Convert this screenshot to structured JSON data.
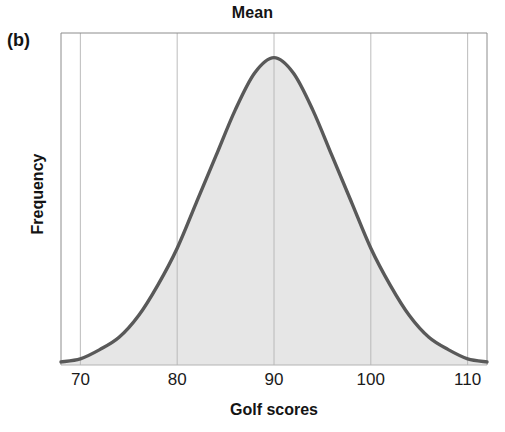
{
  "figure": {
    "panel_label": "(b)",
    "title": "Mean",
    "xlabel": "Golf scores",
    "ylabel": "Frequency"
  },
  "colors": {
    "curve_stroke": "#595959",
    "area_fill": "#e6e6e6",
    "gridline": "#b4b4b4",
    "axis_border": "#8c8c8c",
    "text": "#141414",
    "background": "#ffffff"
  },
  "chart_data": {
    "type": "area",
    "title": "Mean",
    "xlabel": "Golf scores",
    "ylabel": "Frequency",
    "xlim": [
      68,
      112
    ],
    "ylim": [
      0,
      1.08
    ],
    "xticks": [
      70,
      80,
      90,
      100,
      110
    ],
    "xtick_labels": [
      "70",
      "80",
      "90",
      "100",
      "110"
    ],
    "yticks": [],
    "ytick_labels": [],
    "grid": "vertical-only",
    "legend": "none",
    "annotations": [
      {
        "text": "Mean",
        "x": 90,
        "position": "top-center",
        "note": "title marks the mean of the distribution at x = 90"
      },
      {
        "text": "(b)",
        "position": "outside-top-left",
        "note": "panel identifier"
      }
    ],
    "distribution": {
      "shape": "normal",
      "mean": 90,
      "std": 9.5,
      "peak_x": 90,
      "peak_y": 1.0,
      "symmetric": true
    },
    "x": [
      68,
      70,
      72,
      74,
      76,
      78,
      80,
      82,
      84,
      86,
      88,
      90,
      92,
      94,
      96,
      98,
      100,
      102,
      104,
      106,
      108,
      110,
      112
    ],
    "values": [
      0.01,
      0.02,
      0.05,
      0.09,
      0.16,
      0.26,
      0.38,
      0.53,
      0.68,
      0.83,
      0.95,
      1.0,
      0.95,
      0.83,
      0.68,
      0.53,
      0.38,
      0.26,
      0.16,
      0.09,
      0.05,
      0.02,
      0.01
    ],
    "series": [
      {
        "name": "Frequency",
        "values": [
          0.01,
          0.02,
          0.05,
          0.09,
          0.16,
          0.26,
          0.38,
          0.53,
          0.68,
          0.83,
          0.95,
          1.0,
          0.95,
          0.83,
          0.68,
          0.53,
          0.38,
          0.26,
          0.16,
          0.09,
          0.05,
          0.02,
          0.01
        ]
      }
    ]
  }
}
